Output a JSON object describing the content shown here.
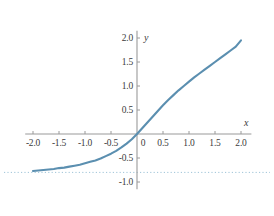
{
  "chart_data": {
    "type": "line",
    "title": "",
    "xlabel": "x",
    "ylabel": "y",
    "xlim": [
      -2.15,
      2.2
    ],
    "ylim": [
      -1.15,
      2.15
    ],
    "grid": false,
    "legend": null,
    "axis_style": "centered-cross",
    "curve_color": "#5b8fb0",
    "asymptote_color": "#9fc4d8",
    "axis_color": "#9a9a9a",
    "text_color": "#3b3b3b",
    "x_ticks": [
      "-2.0",
      "-1.5",
      "-1.0",
      "-0.5",
      "0",
      "0.5",
      "1.0",
      "1.5",
      "2.0"
    ],
    "x_tick_values": [
      -2.0,
      -1.5,
      -1.0,
      -0.5,
      0,
      0.5,
      1.0,
      1.5,
      2.0
    ],
    "y_ticks": [
      "2.0",
      "1.5",
      "1.0",
      "0.5",
      "-0.5",
      "-1.0"
    ],
    "y_tick_values": [
      2.0,
      1.5,
      1.0,
      0.5,
      -0.5,
      -1.0
    ],
    "annotations": [
      {
        "name": "horizontal-asymptote",
        "type": "hline",
        "y": -0.8,
        "style": "dotted"
      }
    ],
    "series": [
      {
        "name": "curve",
        "x": [
          -2.0,
          -1.9,
          -1.8,
          -1.7,
          -1.6,
          -1.5,
          -1.4,
          -1.3,
          -1.2,
          -1.1,
          -1.0,
          -0.9,
          -0.8,
          -0.7,
          -0.6,
          -0.5,
          -0.4,
          -0.3,
          -0.2,
          -0.1,
          0.0,
          0.1,
          0.2,
          0.3,
          0.4,
          0.5,
          0.6,
          0.7,
          0.8,
          0.9,
          1.0,
          1.1,
          1.2,
          1.3,
          1.4,
          1.5,
          1.6,
          1.7,
          1.8,
          1.9,
          2.0
        ],
        "y": [
          -0.77,
          -0.76,
          -0.75,
          -0.74,
          -0.73,
          -0.71,
          -0.7,
          -0.68,
          -0.66,
          -0.64,
          -0.61,
          -0.58,
          -0.55,
          -0.51,
          -0.46,
          -0.41,
          -0.35,
          -0.28,
          -0.2,
          -0.11,
          0.0,
          0.12,
          0.24,
          0.36,
          0.48,
          0.6,
          0.71,
          0.81,
          0.91,
          1.0,
          1.09,
          1.18,
          1.26,
          1.34,
          1.42,
          1.5,
          1.58,
          1.66,
          1.74,
          1.82,
          1.95
        ]
      }
    ]
  }
}
